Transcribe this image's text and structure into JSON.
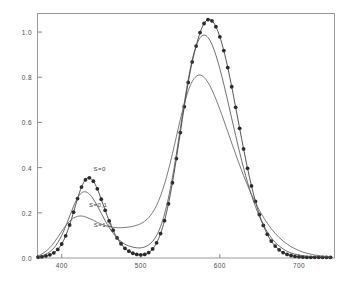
{
  "chart_data": {
    "type": "line",
    "title": "",
    "subtitle": "",
    "xlabel": "",
    "ylabel": "",
    "xlim": [
      370,
      745
    ],
    "ylim": [
      0.0,
      1.08
    ],
    "grid": false,
    "legend_position": "inline-annotations",
    "frame": "box",
    "xticks": [
      400,
      500,
      600,
      700
    ],
    "xtick_labels": [
      "400",
      "500",
      "600",
      "700"
    ],
    "yticks": [
      0.0,
      0.2,
      0.4,
      0.6,
      0.8,
      1.0
    ],
    "ytick_labels": [
      "0.0",
      "0.2",
      "0.4",
      "0.6",
      "0.8",
      "1.0"
    ],
    "annotations": [
      {
        "text": "S=0",
        "x": 448,
        "y": 0.395
      },
      {
        "text": "S=0,1",
        "x": 446,
        "y": 0.235
      },
      {
        "text": "S=1,0",
        "x": 452,
        "y": 0.145
      }
    ],
    "series": [
      {
        "name": "S=0",
        "style": "line-with-markers",
        "marker": "filled-circle",
        "color": "#2b2b2b",
        "x": [
          370,
          375,
          380,
          385,
          390,
          395,
          400,
          405,
          410,
          415,
          420,
          425,
          430,
          435,
          440,
          445,
          450,
          455,
          460,
          465,
          470,
          475,
          480,
          485,
          490,
          495,
          500,
          505,
          510,
          515,
          520,
          525,
          530,
          535,
          540,
          545,
          550,
          555,
          560,
          565,
          570,
          575,
          580,
          585,
          590,
          595,
          600,
          605,
          610,
          615,
          620,
          625,
          630,
          635,
          640,
          645,
          650,
          655,
          660,
          665,
          670,
          675,
          680,
          685,
          690,
          695,
          700,
          705,
          710,
          715,
          720,
          725,
          730,
          735,
          740
        ],
        "y": [
          0.004,
          0.006,
          0.009,
          0.014,
          0.023,
          0.038,
          0.062,
          0.098,
          0.146,
          0.203,
          0.263,
          0.314,
          0.346,
          0.355,
          0.34,
          0.306,
          0.26,
          0.211,
          0.164,
          0.123,
          0.089,
          0.063,
          0.043,
          0.03,
          0.021,
          0.016,
          0.014,
          0.016,
          0.024,
          0.04,
          0.067,
          0.108,
          0.165,
          0.24,
          0.333,
          0.44,
          0.555,
          0.67,
          0.777,
          0.868,
          0.938,
          0.998,
          1.038,
          1.055,
          1.05,
          1.024,
          0.979,
          0.918,
          0.843,
          0.758,
          0.667,
          0.574,
          0.483,
          0.397,
          0.319,
          0.251,
          0.192,
          0.144,
          0.105,
          0.075,
          0.053,
          0.036,
          0.024,
          0.016,
          0.011,
          0.007,
          0.005,
          0.004,
          0.003,
          0.003,
          0.003,
          0.003,
          0.003,
          0.003,
          0.003
        ]
      },
      {
        "name": "S=0,1",
        "style": "line",
        "marker": "none",
        "color": "#4a4a4a",
        "x": [
          370,
          375,
          380,
          385,
          390,
          395,
          400,
          405,
          410,
          415,
          420,
          425,
          430,
          435,
          440,
          445,
          450,
          455,
          460,
          465,
          470,
          475,
          480,
          485,
          490,
          495,
          500,
          505,
          510,
          515,
          520,
          525,
          530,
          535,
          540,
          545,
          550,
          555,
          560,
          565,
          570,
          575,
          580,
          585,
          590,
          595,
          600,
          605,
          610,
          615,
          620,
          625,
          630,
          635,
          640,
          645,
          650,
          655,
          660,
          665,
          670,
          675,
          680,
          685,
          690,
          695,
          700,
          705,
          710,
          715,
          720,
          725,
          730,
          735,
          740
        ],
        "y": [
          0.006,
          0.01,
          0.017,
          0.028,
          0.044,
          0.068,
          0.1,
          0.14,
          0.185,
          0.229,
          0.266,
          0.288,
          0.293,
          0.283,
          0.261,
          0.231,
          0.198,
          0.165,
          0.135,
          0.11,
          0.089,
          0.073,
          0.061,
          0.053,
          0.048,
          0.045,
          0.045,
          0.049,
          0.058,
          0.074,
          0.1,
          0.139,
          0.194,
          0.266,
          0.356,
          0.46,
          0.573,
          0.686,
          0.79,
          0.876,
          0.938,
          0.975,
          0.987,
          0.976,
          0.945,
          0.898,
          0.838,
          0.769,
          0.695,
          0.618,
          0.542,
          0.468,
          0.399,
          0.335,
          0.278,
          0.228,
          0.184,
          0.147,
          0.116,
          0.09,
          0.069,
          0.053,
          0.04,
          0.03,
          0.022,
          0.017,
          0.013,
          0.01,
          0.008,
          0.007,
          0.006,
          0.005,
          0.005,
          0.004,
          0.004
        ]
      },
      {
        "name": "S=1,0",
        "style": "line",
        "marker": "none",
        "color": "#5a5a5a",
        "x": [
          370,
          375,
          380,
          385,
          390,
          395,
          400,
          405,
          410,
          415,
          420,
          425,
          430,
          435,
          440,
          445,
          450,
          455,
          460,
          465,
          470,
          475,
          480,
          485,
          490,
          495,
          500,
          505,
          510,
          515,
          520,
          525,
          530,
          535,
          540,
          545,
          550,
          555,
          560,
          565,
          570,
          575,
          580,
          585,
          590,
          595,
          600,
          605,
          610,
          615,
          620,
          625,
          630,
          635,
          640,
          645,
          650,
          655,
          660,
          665,
          670,
          675,
          680,
          685,
          690,
          695,
          700,
          705,
          710,
          715,
          720,
          725,
          730,
          735,
          740
        ],
        "y": [
          0.01,
          0.018,
          0.03,
          0.046,
          0.067,
          0.092,
          0.118,
          0.143,
          0.163,
          0.177,
          0.184,
          0.186,
          0.182,
          0.175,
          0.167,
          0.158,
          0.15,
          0.144,
          0.139,
          0.136,
          0.134,
          0.134,
          0.135,
          0.137,
          0.14,
          0.145,
          0.152,
          0.163,
          0.179,
          0.202,
          0.233,
          0.275,
          0.327,
          0.39,
          0.461,
          0.537,
          0.613,
          0.682,
          0.74,
          0.781,
          0.804,
          0.81,
          0.8,
          0.777,
          0.744,
          0.703,
          0.658,
          0.609,
          0.559,
          0.509,
          0.459,
          0.411,
          0.365,
          0.322,
          0.282,
          0.245,
          0.211,
          0.181,
          0.154,
          0.13,
          0.109,
          0.091,
          0.075,
          0.062,
          0.05,
          0.041,
          0.033,
          0.026,
          0.021,
          0.017,
          0.013,
          0.011,
          0.008,
          0.007,
          0.005
        ]
      }
    ]
  }
}
